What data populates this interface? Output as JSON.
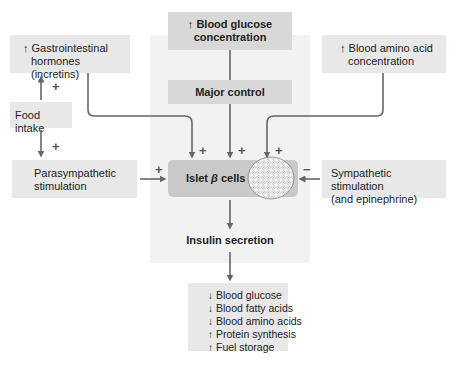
{
  "diagram": {
    "nodes": {
      "blood_glucose": {
        "prefix": "↑",
        "line1": "Blood glucose",
        "line2": "concentration"
      },
      "major_control": {
        "label": "Major control"
      },
      "gi_hormones": {
        "prefix": "↑",
        "line1": "Gastrointestinal",
        "line2": "hormones (incretins)"
      },
      "food_intake": {
        "label": "Food intake"
      },
      "parasympathetic": {
        "line1": "Parasympathetic",
        "line2": "stimulation"
      },
      "amino_acid": {
        "prefix": "↑",
        "line1": "Blood amino acid",
        "line2": "concentration"
      },
      "sympathetic": {
        "line1": "Sympathetic stimulation",
        "line2": "(and epinephrine)"
      },
      "islet": {
        "label_pre": "Islet ",
        "label_beta": "β",
        "label_post": " cells"
      },
      "insulin_secretion": {
        "label": "Insulin secretion"
      }
    },
    "effects": [
      {
        "direction": "↓",
        "label": "Blood glucose"
      },
      {
        "direction": "↓",
        "label": "Blood fatty acids"
      },
      {
        "direction": "↓",
        "label": "Blood amino acids"
      },
      {
        "direction": "↑",
        "label": "Protein synthesis"
      },
      {
        "direction": "↑",
        "label": "Fuel storage"
      }
    ],
    "signs": {
      "food_to_gi": "+",
      "food_to_para": "+",
      "gi_to_islet": "+",
      "control_to_islet": "+",
      "amino_to_islet": "+",
      "para_to_islet": "+",
      "symp_to_islet": "−"
    },
    "colors": {
      "panel": "#f2f2f2",
      "box": "#e8e8e8",
      "dark_box": "#d8d8d8",
      "islet": "#c9c9c9",
      "arrow": "#666666"
    }
  }
}
